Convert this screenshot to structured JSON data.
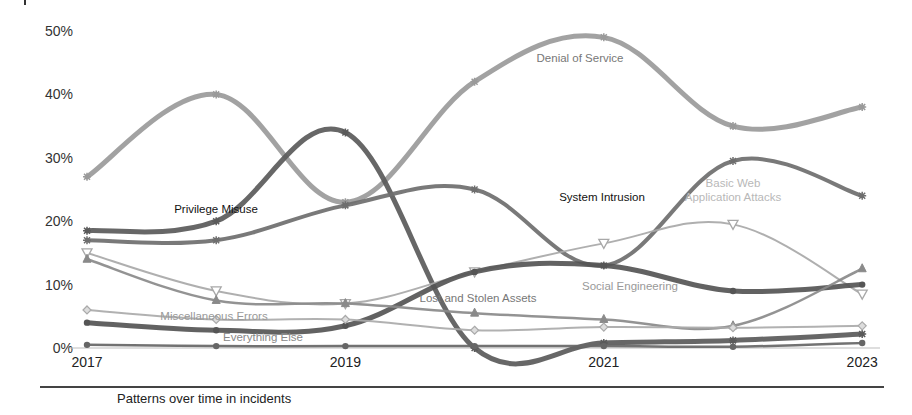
{
  "chart_data": {
    "type": "line",
    "title": "",
    "caption": "Patterns over time in incidents",
    "xlabel": "",
    "ylabel": "",
    "x": [
      2017,
      2018,
      2019,
      2020,
      2021,
      2022,
      2023
    ],
    "x_tick_labels": [
      "2017",
      "2019",
      "2021",
      "2023"
    ],
    "y_tick_labels": [
      "0%",
      "10%",
      "20%",
      "30%",
      "40%",
      "50%"
    ],
    "ylim": [
      0,
      50
    ],
    "grid": false,
    "legend": "inline labels",
    "series": [
      {
        "name": "Denial of Service",
        "values": [
          27,
          40,
          23,
          42,
          49,
          35,
          38
        ],
        "color": "#9a9a9a",
        "width": 5,
        "marker": "star",
        "label_pos": [
          580,
          62
        ],
        "label_color": "#777777"
      },
      {
        "name": "Privilege Misuse",
        "values": [
          18.5,
          20,
          34,
          0,
          0.8,
          1.2,
          2.2
        ],
        "color": "#5a5a5a",
        "width": 5,
        "marker": "cross",
        "label_pos": [
          216,
          213
        ],
        "label_color": "#111111"
      },
      {
        "name": "System Intrusion",
        "values": [
          17,
          17,
          22.5,
          25,
          13,
          29.5,
          24
        ],
        "color": "#6e6e6e",
        "width": 4,
        "marker": "star",
        "label_pos": [
          602,
          201
        ],
        "label_color": "#111111"
      },
      {
        "name": "Basic Web Application Attacks",
        "values": [
          15,
          9,
          7,
          12,
          16.5,
          19.5,
          8.5
        ],
        "color": "#a8a8a8",
        "width": 2,
        "marker": "triangle-down",
        "label_pos": [
          733,
          187
        ],
        "label_color": "#b8b8b8",
        "label_lines": [
          "Basic Web",
          "Application Attacks"
        ]
      },
      {
        "name": "Social Engineering",
        "values": [
          4,
          2.8,
          3.5,
          12,
          13,
          9,
          10
        ],
        "color": "#555555",
        "width": 5,
        "marker": "circle",
        "label_pos": [
          630,
          290
        ],
        "label_color": "#999999"
      },
      {
        "name": "Lost and Stolen Assets",
        "values": [
          14,
          7.5,
          7,
          5.5,
          4.5,
          3.5,
          12.5
        ],
        "color": "#8a8a8a",
        "width": 2.5,
        "marker": "triangle-up",
        "label_pos": [
          478,
          302
        ],
        "label_color": "#777777"
      },
      {
        "name": "Miscellaneous Errors",
        "values": [
          6,
          4.5,
          4.5,
          2.8,
          3.3,
          3.2,
          3.5
        ],
        "color": "#aaaaaa",
        "width": 2,
        "marker": "diamond",
        "label_pos": [
          214,
          320
        ],
        "label_color": "#999999"
      },
      {
        "name": "Everything Else",
        "values": [
          0.5,
          0.3,
          0.3,
          0.3,
          0.3,
          0.2,
          0.8
        ],
        "color": "#666666",
        "width": 2.5,
        "marker": "circle",
        "label_pos": [
          263,
          341
        ],
        "label_color": "#888888"
      }
    ]
  }
}
